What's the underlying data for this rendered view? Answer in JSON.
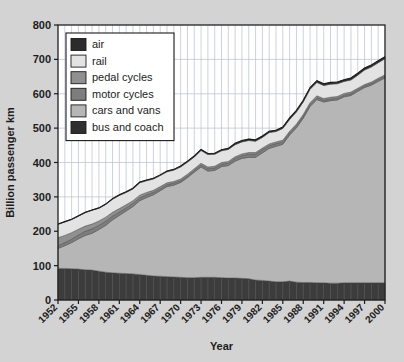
{
  "chart_data": {
    "type": "area",
    "stacked": true,
    "title": "",
    "xlabel": "Year",
    "ylabel": "Billion passenger km",
    "xlim": [
      1952,
      2000
    ],
    "ylim": [
      0,
      800
    ],
    "ytick_step": 100,
    "yticks": [
      0,
      100,
      200,
      300,
      400,
      500,
      600,
      700,
      800
    ],
    "xticks": [
      1952,
      1955,
      1958,
      1961,
      1964,
      1967,
      1970,
      1973,
      1976,
      1979,
      1982,
      1985,
      1988,
      1991,
      1994,
      1997,
      2000
    ],
    "grid": true,
    "grid_vertical_every_year": true,
    "legend_position": "top-left-inside",
    "x": [
      1952,
      1953,
      1954,
      1955,
      1956,
      1957,
      1958,
      1959,
      1960,
      1961,
      1962,
      1963,
      1964,
      1965,
      1966,
      1967,
      1968,
      1969,
      1970,
      1971,
      1972,
      1973,
      1974,
      1975,
      1976,
      1977,
      1978,
      1979,
      1980,
      1981,
      1982,
      1983,
      1984,
      1985,
      1986,
      1987,
      1988,
      1989,
      1990,
      1991,
      1992,
      1993,
      1994,
      1995,
      1996,
      1997,
      1998,
      1999,
      2000
    ],
    "series": [
      {
        "name": "bus and coach",
        "color": "#3c3c3c",
        "values": [
          92,
          92,
          91,
          90,
          88,
          87,
          84,
          81,
          79,
          78,
          77,
          76,
          74,
          72,
          70,
          69,
          68,
          67,
          66,
          65,
          65,
          66,
          66,
          66,
          65,
          64,
          64,
          63,
          62,
          58,
          57,
          55,
          53,
          53,
          55,
          52,
          51,
          51,
          50,
          50,
          49,
          49,
          50,
          50,
          50,
          50,
          50,
          50,
          50
        ]
      },
      {
        "name": "cars and vans",
        "color": "#b6b6b6",
        "values": [
          58,
          66,
          76,
          88,
          100,
          107,
          121,
          136,
          154,
          168,
          182,
          196,
          215,
          226,
          236,
          249,
          262,
          267,
          276,
          291,
          307,
          321,
          309,
          311,
          323,
          327,
          340,
          349,
          353,
          357,
          371,
          386,
          394,
          400,
          425,
          449,
          478,
          512,
          533,
          526,
          531,
          533,
          541,
          545,
          557,
          568,
          575,
          586,
          596
        ]
      },
      {
        "name": "motor cycles",
        "color": "#7d7d7d",
        "values": [
          8,
          9,
          10,
          11,
          12,
          13,
          12,
          12,
          11,
          10,
          9,
          9,
          8,
          8,
          7,
          6,
          6,
          6,
          5,
          5,
          5,
          6,
          7,
          7,
          7,
          7,
          8,
          8,
          9,
          9,
          9,
          8,
          8,
          7,
          6,
          6,
          6,
          6,
          6,
          5,
          5,
          5,
          5,
          5,
          5,
          5,
          5,
          5,
          5
        ]
      },
      {
        "name": "pedal cycles",
        "color": "#909090",
        "values": [
          23,
          21,
          19,
          17,
          15,
          14,
          13,
          12,
          11,
          10,
          9,
          8,
          8,
          7,
          6,
          6,
          5,
          5,
          5,
          5,
          5,
          5,
          5,
          5,
          5,
          5,
          5,
          5,
          5,
          5,
          5,
          5,
          5,
          5,
          5,
          5,
          5,
          5,
          5,
          5,
          5,
          5,
          5,
          5,
          4,
          4,
          4,
          4,
          4
        ]
      },
      {
        "name": "rail",
        "color": "#e3e3e3",
        "values": [
          39,
          39,
          38,
          38,
          39,
          40,
          37,
          37,
          38,
          38,
          36,
          34,
          36,
          34,
          33,
          32,
          32,
          33,
          35,
          35,
          34,
          37,
          36,
          35,
          34,
          35,
          35,
          35,
          35,
          33,
          31,
          33,
          30,
          34,
          34,
          35,
          36,
          39,
          39,
          38,
          38,
          37,
          35,
          35,
          38,
          42,
          44,
          45,
          47
        ]
      },
      {
        "name": "air",
        "color": "#2b2b2b",
        "values": [
          1,
          1,
          1,
          1,
          1,
          1,
          1,
          1,
          2,
          2,
          2,
          2,
          2,
          2,
          2,
          2,
          2,
          2,
          3,
          3,
          3,
          3,
          3,
          3,
          3,
          3,
          4,
          4,
          4,
          4,
          4,
          4,
          4,
          4,
          5,
          5,
          5,
          5,
          5,
          5,
          5,
          5,
          5,
          6,
          6,
          6,
          6,
          6,
          6
        ]
      }
    ],
    "totals": [
      221,
      228,
      235,
      245,
      255,
      262,
      268,
      279,
      295,
      306,
      315,
      325,
      343,
      349,
      354,
      364,
      375,
      380,
      390,
      404,
      419,
      438,
      426,
      427,
      437,
      441,
      456,
      464,
      468,
      466,
      477,
      491,
      494,
      503,
      530,
      552,
      581,
      618,
      638,
      629,
      633,
      634,
      641,
      646,
      660,
      675,
      684,
      696,
      708
    ]
  },
  "legend": {
    "items": [
      {
        "label": "air",
        "color": "#2b2b2b"
      },
      {
        "label": "rail",
        "color": "#e3e3e3"
      },
      {
        "label": "pedal cycles",
        "color": "#909090"
      },
      {
        "label": "motor cycles",
        "color": "#7d7d7d"
      },
      {
        "label": "cars and vans",
        "color": "#b6b6b6"
      },
      {
        "label": "bus and coach",
        "color": "#2f2f2f"
      }
    ]
  },
  "colors": {
    "background": "#d3d3d3",
    "plot_background": "#ffffff",
    "axis": "#1c1c1c",
    "grid": "#b9bed0",
    "text": "#1c1c1c"
  }
}
